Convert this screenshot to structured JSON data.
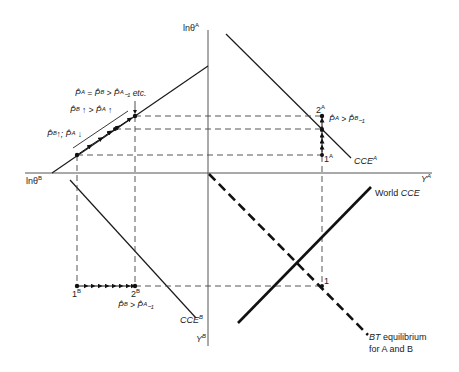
{
  "axes": {
    "vertical_top_label": "lnθ",
    "vertical_top_sup": "A",
    "horizontal_left_label": "lnθ",
    "horizontal_left_sup": "B",
    "horizontal_right_label": "Y",
    "horizontal_right_sup": "A",
    "vertical_bottom_label": "Y",
    "vertical_bottom_sup": "B"
  },
  "curves": {
    "cce_a": {
      "label": "CCE",
      "sup": "A"
    },
    "cce_b": {
      "label": "CCE",
      "sup": "B"
    },
    "world_cce": {
      "prefix": "World ",
      "label": "CCE"
    },
    "bt_equilibrium": {
      "line1_ital": "BT",
      "line1_rest": " equilibrium",
      "line2": "for A and B"
    }
  },
  "points": {
    "p1_main": "1",
    "p1a": "1",
    "p1a_sup": "A",
    "p2a": "2",
    "p2a_sup": "A",
    "p1b": "1",
    "p1b_sup": "B",
    "p2b": "2",
    "p2b_sup": "B"
  },
  "annotations": {
    "top_eq": "P̂ᴬ = P̂ᴮ > P̂ᴬ₋₁ etc.",
    "mid_rel": "P̂ᴮ ↑ > P̂ᴬ ↑",
    "low_rel": "P̂ᴮ↑; P̂ᴬ ↓",
    "right_rel": "P̂ᴬ > P̂ᴮ₋₁",
    "bottom_rel": "P̂ᴮ > P̂ᴬ₋₁"
  },
  "colors": {
    "line": "#1a1a1a",
    "axis": "#555555",
    "dash": "#444444"
  }
}
